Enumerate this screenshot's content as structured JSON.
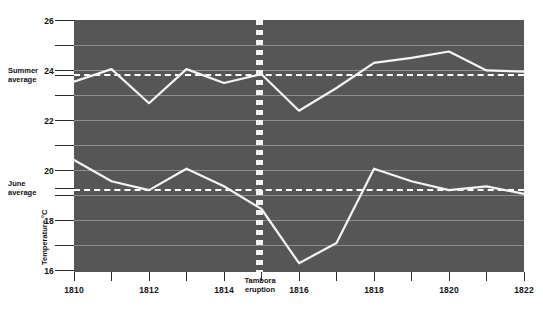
{
  "chart_data": {
    "type": "line",
    "title": "",
    "subtitle": "",
    "xlabel": "",
    "ylabel": "Temperature °C",
    "xlim": [
      1810,
      1822
    ],
    "ylim": [
      16,
      26
    ],
    "grid": true,
    "legend_position": "none",
    "x": [
      1810,
      1811,
      1812,
      1813,
      1814,
      1815,
      1816,
      1817,
      1818,
      1819,
      1820,
      1821,
      1822
    ],
    "x_major_ticks": [
      "1810",
      "1812",
      "1814",
      "1816",
      "1818",
      "1820",
      "1822"
    ],
    "x_minor_ticks": [
      "1811",
      "1813",
      "1815",
      "1817",
      "1819",
      "1821"
    ],
    "y_major_ticks": [
      "26",
      "24",
      "22",
      "20",
      "18",
      "16"
    ],
    "y_minor_ticks": [
      "25",
      "23",
      "21",
      "19",
      "17"
    ],
    "series": [
      {
        "name": "Summer temperature",
        "values": [
          23.55,
          24.05,
          22.7,
          24.05,
          23.5,
          23.85,
          22.4,
          23.3,
          24.3,
          24.5,
          24.75,
          24.0,
          23.95
        ]
      },
      {
        "name": "June temperature",
        "values": [
          20.45,
          19.6,
          19.25,
          20.1,
          19.4,
          18.5,
          16.35,
          17.15,
          20.1,
          19.6,
          19.25,
          19.4,
          19.1
        ]
      }
    ],
    "reference_lines": [
      {
        "label_line1": "Summer",
        "label_line2": "average",
        "value": 23.85
      },
      {
        "label_line1": "June",
        "label_line2": "average",
        "value": 19.3
      }
    ],
    "annotations": [
      {
        "label_line1": "Tambora",
        "label_line2": "eruption",
        "x": 1814.93
      }
    ],
    "colors": {
      "plot_background": "#565656",
      "series_line": "#f4f4f4",
      "gridline": "#8e8e8e",
      "average_line": "#ffffff",
      "axis": "#2b2b2b",
      "page_background": "#ffffff"
    }
  }
}
